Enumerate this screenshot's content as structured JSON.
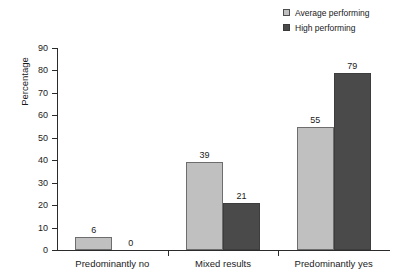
{
  "chart_data": {
    "type": "bar",
    "title": "",
    "subtitle": "",
    "xlabel": "",
    "ylabel": "Percentage",
    "ylim": [
      0,
      90
    ],
    "ytick_step": 10,
    "yticks": [
      "0",
      "10",
      "20",
      "30",
      "40",
      "50",
      "60",
      "70",
      "80",
      "90"
    ],
    "grid": false,
    "legend_position": "top-right",
    "categories": [
      "Predominantly no",
      "Mixed results",
      "Predominantly yes"
    ],
    "series": [
      {
        "name": "Average performing",
        "color": "#c0c0c0",
        "values": [
          6,
          39,
          55
        ],
        "labels": [
          "6",
          "39",
          "55"
        ]
      },
      {
        "name": "High performing",
        "color": "#4a4a4a",
        "values": [
          0,
          21,
          79
        ],
        "labels": [
          "0",
          "21",
          "79"
        ]
      }
    ]
  },
  "legend": {
    "items": [
      {
        "label": "Average performing",
        "swatch": "light-gray-square-icon"
      },
      {
        "label": "High performing",
        "swatch": "dark-gray-square-icon"
      }
    ]
  },
  "axes": {
    "y_title": "Percentage"
  },
  "colors": {
    "average_performing": "#c0c0c0",
    "high_performing": "#4a4a4a",
    "axis": "#2b2b2b",
    "text": "#1a1a1a",
    "background": "#ffffff"
  }
}
